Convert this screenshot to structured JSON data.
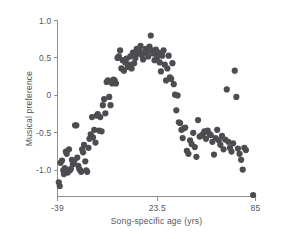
{
  "chart_data": {
    "type": "scatter",
    "title": "",
    "xlabel": "Song-specific age (yrs)",
    "ylabel": "Musical preference",
    "xlim": [
      -39,
      85
    ],
    "ylim": [
      -1.35,
      1.0
    ],
    "grid": false,
    "legend": null,
    "xticks": [
      -39,
      23.5,
      85
    ],
    "xtick_labels": [
      "-39",
      "23.5",
      "85"
    ],
    "yticks": [
      1.0,
      0.5,
      0,
      -0.5,
      -1.0
    ],
    "ytick_labels": [
      "1.0",
      "0.5",
      "0",
      "-0.5",
      "-1.0"
    ],
    "marker_color": "#4c4d50",
    "marker_size": 3.1,
    "points": [
      [
        -38.2,
        -1.16
      ],
      [
        -37.6,
        -1.21
      ],
      [
        -37.1,
        -0.9
      ],
      [
        -36.2,
        -0.87
      ],
      [
        -35.4,
        -1.0
      ],
      [
        -35.0,
        -1.05
      ],
      [
        -34.4,
        -0.97
      ],
      [
        -33.8,
        -0.75
      ],
      [
        -33.2,
        -0.78
      ],
      [
        -32.6,
        -1.03
      ],
      [
        -31.8,
        -0.72
      ],
      [
        -31.2,
        -1.0
      ],
      [
        -30.6,
        -0.98
      ],
      [
        -30.0,
        -0.86
      ],
      [
        -29.4,
        -0.92
      ],
      [
        -28.6,
        -0.88
      ],
      [
        -28.0,
        -0.4
      ],
      [
        -27.2,
        -0.4
      ],
      [
        -26.6,
        -0.83
      ],
      [
        -26.0,
        -0.94
      ],
      [
        -25.4,
        -0.98
      ],
      [
        -24.8,
        -1.0
      ],
      [
        -24.2,
        -1.02
      ],
      [
        -23.6,
        -0.72
      ],
      [
        -23.0,
        -0.76
      ],
      [
        -22.4,
        -0.66
      ],
      [
        -21.6,
        -0.88
      ],
      [
        -21.0,
        -1.0
      ],
      [
        -20.4,
        -1.02
      ],
      [
        -19.6,
        -0.7
      ],
      [
        -19.0,
        -0.58
      ],
      [
        -18.2,
        -0.52
      ],
      [
        -17.4,
        -0.29
      ],
      [
        -16.8,
        -0.56
      ],
      [
        -16.0,
        -0.46
      ],
      [
        -15.2,
        -0.63
      ],
      [
        -14.4,
        -0.27
      ],
      [
        -13.8,
        -0.25
      ],
      [
        -13.0,
        -0.47
      ],
      [
        -12.2,
        -0.29
      ],
      [
        -11.4,
        -0.48
      ],
      [
        -10.6,
        -0.13
      ],
      [
        -9.8,
        -0.05
      ],
      [
        -9.0,
        -0.24
      ],
      [
        -8.2,
        0.18
      ],
      [
        -7.4,
        0.2
      ],
      [
        -6.6,
        -0.02
      ],
      [
        -5.8,
        -0.13
      ],
      [
        -4.8,
        0.16
      ],
      [
        -4.0,
        0.21
      ],
      [
        -3.2,
        0.2
      ],
      [
        -2.4,
        0.16
      ],
      [
        -1.4,
        0.5
      ],
      [
        -0.6,
        0.52
      ],
      [
        0.2,
        0.6
      ],
      [
        1.0,
        0.36
      ],
      [
        1.8,
        0.47
      ],
      [
        2.6,
        0.33
      ],
      [
        3.4,
        0.44
      ],
      [
        4.2,
        0.49
      ],
      [
        5.0,
        0.38
      ],
      [
        5.8,
        0.41
      ],
      [
        6.6,
        0.52
      ],
      [
        7.4,
        0.36
      ],
      [
        8.2,
        0.57
      ],
      [
        9.0,
        0.43
      ],
      [
        9.8,
        0.5
      ],
      [
        10.6,
        0.62
      ],
      [
        11.4,
        0.56
      ],
      [
        12.2,
        0.61
      ],
      [
        13.0,
        0.66
      ],
      [
        13.8,
        0.54
      ],
      [
        14.6,
        0.48
      ],
      [
        15.4,
        0.57
      ],
      [
        16.2,
        0.62
      ],
      [
        17.0,
        0.58
      ],
      [
        17.8,
        0.52
      ],
      [
        18.6,
        0.65
      ],
      [
        19.4,
        0.8
      ],
      [
        20.2,
        0.6
      ],
      [
        21.0,
        0.56
      ],
      [
        21.8,
        0.47
      ],
      [
        22.6,
        0.61
      ],
      [
        23.4,
        0.51
      ],
      [
        24.2,
        0.57
      ],
      [
        25.0,
        0.44
      ],
      [
        25.8,
        0.32
      ],
      [
        26.6,
        0.53
      ],
      [
        27.4,
        0.6
      ],
      [
        28.2,
        0.41
      ],
      [
        29.0,
        0.2
      ],
      [
        29.8,
        0.36
      ],
      [
        30.6,
        0.53
      ],
      [
        31.4,
        0.24
      ],
      [
        32.2,
        0.22
      ],
      [
        33.0,
        0.43
      ],
      [
        33.8,
        0.15
      ],
      [
        34.6,
        0.01
      ],
      [
        35.4,
        -0.2
      ],
      [
        36.2,
        0.0
      ],
      [
        37.0,
        -0.36
      ],
      [
        37.8,
        -0.37
      ],
      [
        38.6,
        -0.46
      ],
      [
        39.4,
        -0.57
      ],
      [
        40.2,
        -0.44
      ],
      [
        41.0,
        -0.43
      ],
      [
        42.0,
        -0.74
      ],
      [
        43.0,
        -0.78
      ],
      [
        44.0,
        -0.6
      ],
      [
        45.0,
        -0.65
      ],
      [
        46.0,
        -0.5
      ],
      [
        47.0,
        -0.69
      ],
      [
        48.0,
        -0.82
      ],
      [
        49.0,
        -0.33
      ],
      [
        50.0,
        -0.55
      ],
      [
        51.0,
        -0.54
      ],
      [
        52.0,
        -0.52
      ],
      [
        53.0,
        -0.48
      ],
      [
        54.0,
        -0.58
      ],
      [
        55.0,
        -0.47
      ],
      [
        56.0,
        -0.51
      ],
      [
        57.0,
        -0.53
      ],
      [
        58.0,
        -0.62
      ],
      [
        59.0,
        -0.79
      ],
      [
        60.0,
        -0.57
      ],
      [
        61.0,
        -0.46
      ],
      [
        62.0,
        -0.6
      ],
      [
        63.0,
        -0.66
      ],
      [
        64.0,
        -0.54
      ],
      [
        65.0,
        -0.72
      ],
      [
        66.0,
        -0.59
      ],
      [
        67.0,
        0.08
      ],
      [
        68.0,
        -0.62
      ],
      [
        69.0,
        -0.7
      ],
      [
        70.0,
        -0.75
      ],
      [
        71.0,
        -0.64
      ],
      [
        72.0,
        0.33
      ],
      [
        73.0,
        -0.02
      ],
      [
        74.0,
        -0.71
      ],
      [
        75.0,
        -0.78
      ],
      [
        76.0,
        -0.86
      ],
      [
        77.0,
        -0.99
      ],
      [
        78.0,
        -0.7
      ],
      [
        79.0,
        -0.73
      ],
      [
        83.5,
        -1.33
      ]
    ]
  }
}
